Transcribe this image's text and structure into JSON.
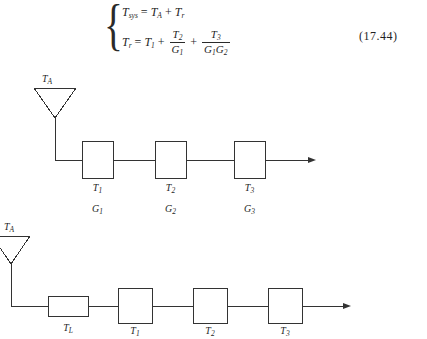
{
  "equation": {
    "number": "(17.44)",
    "line1": {
      "lhs_var": "T",
      "lhs_sub": "sys",
      "eq": "=",
      "term1_var": "T",
      "term1_sub": "A",
      "plus": "+",
      "term2_var": "T",
      "term2_sub": "r"
    },
    "line2": {
      "lhs_var": "T",
      "lhs_sub": "r",
      "eq": "=",
      "term1_var": "T",
      "term1_sub": "1",
      "plus1": "+",
      "frac1_num_var": "T",
      "frac1_num_sub": "2",
      "frac1_den_var": "G",
      "frac1_den_sub": "1",
      "plus2": "+",
      "frac2_num_var": "T",
      "frac2_num_sub": "3",
      "frac2_den_var1": "G",
      "frac2_den_sub1": "1",
      "frac2_den_var2": "G",
      "frac2_den_sub2": "2"
    }
  },
  "diagram_top": {
    "antenna_label_var": "T",
    "antenna_label_sub": "A",
    "blocks": [
      {
        "t_var": "T",
        "t_sub": "1",
        "g_var": "G",
        "g_sub": "1"
      },
      {
        "t_var": "T",
        "t_sub": "2",
        "g_var": "G",
        "g_sub": "2"
      },
      {
        "t_var": "T",
        "t_sub": "3",
        "g_var": "G",
        "g_sub": "3"
      }
    ]
  },
  "diagram_bottom": {
    "antenna_label_var": "T",
    "antenna_label_sub": "A",
    "blocks": [
      {
        "t_var": "T",
        "t_sub": "L"
      },
      {
        "t_var": "T",
        "t_sub": "1"
      },
      {
        "t_var": "T",
        "t_sub": "2"
      },
      {
        "t_var": "T",
        "t_sub": "3"
      }
    ]
  },
  "style": {
    "line_color": "#333333",
    "text_color": "#1f1f1f",
    "background": "#ffffff"
  }
}
